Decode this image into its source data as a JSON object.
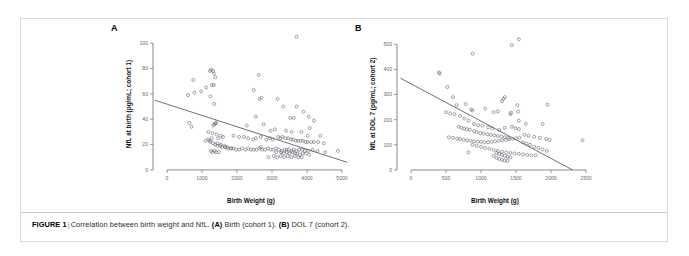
{
  "figure": {
    "caption_label": "FIGURE 1",
    "caption_separator": "|",
    "caption_text_1": "Correlation between birth weight and NfL.",
    "caption_marker_a": "(A)",
    "caption_text_a": "Birth (cohort 1).",
    "caption_marker_b": "(B)",
    "caption_text_b": "DOL 7 (cohort 2).",
    "border_color": "#d9d9d9"
  },
  "chart_data": [
    {
      "type": "scatter",
      "panel": "A",
      "panel_label": "A",
      "title": "",
      "xlabel": "Birth Weight (g)",
      "ylabel": "NfL at birth (pg/mL; cohort 1)",
      "xlim": [
        -400,
        5200
      ],
      "ylim": [
        -4,
        108
      ],
      "xticks": [
        0,
        1000,
        2000,
        3000,
        4000,
        5000
      ],
      "yticks": [
        0,
        20,
        40,
        60,
        80,
        100
      ],
      "grid": false,
      "legend": "none",
      "marker": "open-circle",
      "marker_color": "#5a5a66",
      "fit_line": {
        "x0": -350,
        "y0": 55,
        "x1": 5150,
        "y1": 6
      },
      "x": [
        3700,
        1230,
        1340,
        1260,
        1320,
        2620,
        750,
        1380,
        1280,
        1340,
        1120,
        980,
        780,
        600,
        1240,
        1350,
        2480,
        2700,
        2640,
        3160,
        3700,
        3320,
        3900,
        4050,
        3520,
        4200,
        3620,
        2540,
        4080,
        640,
        700,
        1390,
        1400,
        1320,
        1360,
        2280,
        2760,
        3080,
        2960,
        3400,
        3560,
        3840,
        4020,
        4380,
        1180,
        1300,
        1420,
        1540,
        1600,
        1280,
        1220,
        1460,
        1900,
        2060,
        2200,
        2320,
        2460,
        2540,
        2680,
        2840,
        2940,
        3020,
        3180,
        3240,
        3300,
        3380,
        3460,
        3540,
        3600,
        3680,
        3740,
        3820,
        3880,
        3960,
        4020,
        4120,
        4200,
        4320,
        4480,
        4880,
        1100,
        1180,
        1240,
        1320,
        1380,
        1440,
        1520,
        1580,
        1660,
        1740,
        1820,
        1900,
        1980,
        2060,
        2140,
        2240,
        2320,
        2400,
        2480,
        2560,
        2640,
        2720,
        2800,
        2880,
        2960,
        3040,
        3120,
        3200,
        3280,
        3360,
        3420,
        3480,
        3560,
        3620,
        3700,
        3780,
        3860,
        3940,
        4040,
        4160,
        4300,
        4520,
        1440,
        1540,
        1640,
        1720,
        1840,
        2680,
        3120,
        3260,
        3340,
        3420,
        3500,
        3580,
        3660,
        3720,
        3800,
        3880,
        3960,
        4060,
        1260,
        1300,
        1360,
        1400,
        1480,
        2900,
        3050,
        3150,
        3250,
        3350,
        3450,
        3550,
        3650,
        3750,
        3850
      ],
      "y": [
        105,
        78,
        76,
        79,
        78,
        75,
        71,
        73,
        67,
        67,
        65,
        62,
        61,
        59,
        58,
        52,
        63,
        57,
        56,
        56,
        50,
        50,
        46,
        42,
        41,
        39,
        41,
        42,
        33,
        37,
        34,
        37,
        37,
        35,
        36,
        35,
        36,
        32,
        31,
        31,
        30,
        30,
        27,
        27,
        30,
        29,
        28,
        27,
        26,
        25,
        23,
        25,
        27,
        26,
        26,
        25,
        24,
        25,
        26,
        24,
        25,
        24,
        26,
        25,
        26,
        25,
        25,
        24,
        24,
        23,
        23,
        23,
        23,
        22,
        22,
        22,
        22,
        22,
        21,
        15,
        23,
        24,
        22,
        21,
        20,
        19,
        19,
        18,
        18,
        17,
        17,
        17,
        16,
        16,
        17,
        16,
        17,
        16,
        16,
        16,
        17,
        16,
        16,
        17,
        16,
        16,
        17,
        16,
        15,
        16,
        16,
        16,
        15,
        16,
        15,
        16,
        16,
        15,
        15,
        16,
        15,
        14,
        21,
        20,
        19,
        18,
        17,
        18,
        14,
        14,
        13,
        14,
        13,
        14,
        13,
        13,
        12,
        13,
        13,
        12,
        15,
        14,
        15,
        14,
        14,
        10,
        11,
        10,
        11,
        10,
        11,
        10,
        11,
        10,
        10
      ]
    },
    {
      "type": "scatter",
      "panel": "B",
      "panel_label": "B",
      "title": "",
      "xlabel": "Birth Weight (g)",
      "ylabel": "NfL at DOL 7 (pg/mL; cohort 2)",
      "xlim": [
        -200,
        2600
      ],
      "ylim": [
        -20,
        545
      ],
      "xticks": [
        0,
        500,
        1000,
        1500,
        2000,
        2500
      ],
      "yticks": [
        0,
        100,
        200,
        300,
        400,
        500
      ],
      "grid": false,
      "legend": "none",
      "marker": "open-circle",
      "marker_color": "#5a5a66",
      "fit_line": {
        "x0": -150,
        "y0": 365,
        "x1": 2310,
        "y1": 0
      },
      "x": [
        1540,
        1440,
        880,
        400,
        410,
        520,
        1340,
        1320,
        1300,
        1520,
        1530,
        1950,
        600,
        650,
        780,
        860,
        880,
        1060,
        1180,
        1240,
        1430,
        500,
        560,
        620,
        700,
        760,
        820,
        900,
        960,
        1020,
        1100,
        1160,
        1260,
        1340,
        1420,
        1540,
        1640,
        1880,
        680,
        720,
        760,
        800,
        840,
        900,
        940,
        990,
        1040,
        1090,
        1140,
        1190,
        1240,
        1290,
        1340,
        1390,
        1440,
        1490,
        1540,
        1620,
        1680,
        1760,
        1840,
        1930,
        1980,
        2450,
        540,
        600,
        660,
        700,
        750,
        800,
        850,
        900,
        950,
        1000,
        1050,
        1100,
        1150,
        1200,
        1250,
        1300,
        1350,
        1400,
        1450,
        1500,
        1550,
        1600,
        1650,
        1700,
        1760,
        1820,
        1880,
        1940,
        820,
        880,
        940,
        1000,
        1060,
        1120,
        1180,
        1240,
        1300,
        1360,
        1420,
        1480,
        1540,
        1600,
        1660,
        1720,
        1780,
        1180,
        1220,
        1260,
        1300,
        1340,
        1380,
        1420,
        1220,
        1260,
        1300,
        1340,
        1380
      ],
      "y": [
        520,
        497,
        463,
        388,
        383,
        330,
        290,
        283,
        274,
        258,
        232,
        260,
        290,
        258,
        262,
        240,
        237,
        244,
        230,
        233,
        228,
        230,
        225,
        222,
        215,
        205,
        196,
        183,
        178,
        176,
        170,
        166,
        160,
        168,
        222,
        196,
        184,
        183,
        172,
        168,
        165,
        162,
        160,
        155,
        150,
        147,
        145,
        142,
        140,
        138,
        135,
        133,
        130,
        128,
        172,
        166,
        163,
        140,
        137,
        132,
        128,
        124,
        120,
        118,
        130,
        128,
        125,
        123,
        120,
        118,
        116,
        114,
        113,
        112,
        110,
        110,
        112,
        114,
        116,
        118,
        120,
        122,
        124,
        126,
        128,
        110,
        105,
        100,
        92,
        88,
        82,
        76,
        70,
        100,
        96,
        92,
        88,
        84,
        80,
        76,
        72,
        70,
        68,
        66,
        64,
        62,
        60,
        58,
        58,
        56,
        68,
        64,
        60,
        56,
        52,
        50,
        48,
        44,
        40,
        38,
        36,
        34
      ]
    }
  ]
}
